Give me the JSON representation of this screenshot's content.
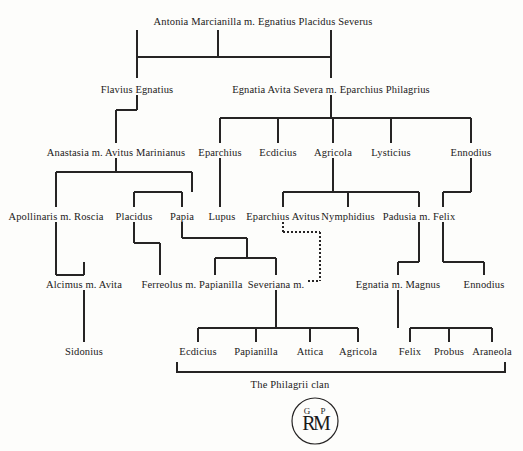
{
  "chart_data": {
    "type": "diagram",
    "title": "The Philagrii clan",
    "subtype": "genealogical-family-tree",
    "generations": 6,
    "nodes": [
      {
        "id": "n1",
        "label": "Antonia Marcianilla m. Egnatius Placidus Severus",
        "x": 263,
        "y": 22,
        "gen": 1
      },
      {
        "id": "n2",
        "label": "Flavius Egnatius",
        "x": 137,
        "y": 90,
        "gen": 2
      },
      {
        "id": "n3",
        "label": "Egnatia Avita Severa m. Eparchius Philagrius",
        "x": 331,
        "y": 90,
        "gen": 2
      },
      {
        "id": "n4",
        "label": "Anastasia m. Avitus Marinianus",
        "x": 116,
        "y": 153,
        "gen": 3
      },
      {
        "id": "n5",
        "label": "Eparchius",
        "x": 220,
        "y": 153,
        "gen": 3
      },
      {
        "id": "n6",
        "label": "Ecdicius",
        "x": 278,
        "y": 153,
        "gen": 3
      },
      {
        "id": "n7",
        "label": "Agricola",
        "x": 333,
        "y": 153,
        "gen": 3
      },
      {
        "id": "n8",
        "label": "Lysticius",
        "x": 391,
        "y": 153,
        "gen": 3
      },
      {
        "id": "n9",
        "label": "Ennodius",
        "x": 471,
        "y": 153,
        "gen": 3
      },
      {
        "id": "n10",
        "label": "Apollinaris m. Roscia",
        "x": 56,
        "y": 217,
        "gen": 4
      },
      {
        "id": "n11",
        "label": "Placidus",
        "x": 134,
        "y": 217,
        "gen": 4
      },
      {
        "id": "n12",
        "label": "Papia",
        "x": 182,
        "y": 217,
        "gen": 4
      },
      {
        "id": "n13",
        "label": "Lupus",
        "x": 222,
        "y": 217,
        "gen": 4
      },
      {
        "id": "n14",
        "label": "Eparchius Avitus",
        "x": 283,
        "y": 217,
        "gen": 4
      },
      {
        "id": "n15",
        "label": "Nymphidius",
        "x": 348,
        "y": 217,
        "gen": 4
      },
      {
        "id": "n16",
        "label": "Padusia m. Felix",
        "x": 419,
        "y": 217,
        "gen": 4
      },
      {
        "id": "n17",
        "label": "Alcimus m. Avita",
        "x": 84,
        "y": 285,
        "gen": 5
      },
      {
        "id": "n18",
        "label": "Ferreolus m. Papianilla",
        "x": 192,
        "y": 285,
        "gen": 5
      },
      {
        "id": "n19",
        "label": "Severiana m.",
        "x": 276,
        "y": 285,
        "gen": 5
      },
      {
        "id": "n20",
        "label": "Egnatia m. Magnus",
        "x": 398,
        "y": 285,
        "gen": 5
      },
      {
        "id": "n21",
        "label": "Ennodius",
        "x": 484,
        "y": 285,
        "gen": 5
      },
      {
        "id": "n22",
        "label": "Sidonius",
        "x": 84,
        "y": 352,
        "gen": 6
      },
      {
        "id": "n23",
        "label": "Ecdicius",
        "x": 198,
        "y": 352,
        "gen": 6
      },
      {
        "id": "n24",
        "label": "Papianilla",
        "x": 256,
        "y": 352,
        "gen": 6
      },
      {
        "id": "n25",
        "label": "Attica",
        "x": 310,
        "y": 352,
        "gen": 6
      },
      {
        "id": "n26",
        "label": "Agricola",
        "x": 358,
        "y": 352,
        "gen": 6
      },
      {
        "id": "n27",
        "label": "Felix",
        "x": 410,
        "y": 352,
        "gen": 6
      },
      {
        "id": "n28",
        "label": "Probus",
        "x": 449,
        "y": 352,
        "gen": 6
      },
      {
        "id": "n29",
        "label": "Araneola",
        "x": 492,
        "y": 352,
        "gen": 6
      }
    ],
    "marriage_links": [
      {
        "from": "Eparchius Avitus",
        "to": "Severiana m.",
        "style": "dashed"
      }
    ],
    "caption": {
      "text": "The Philagrii clan",
      "x": 290,
      "y": 385
    },
    "logo": {
      "type": "circular-monogram",
      "letters_top": [
        "G",
        "P"
      ],
      "letters_main": [
        "R",
        "M"
      ],
      "x": 315,
      "y": 421
    }
  }
}
